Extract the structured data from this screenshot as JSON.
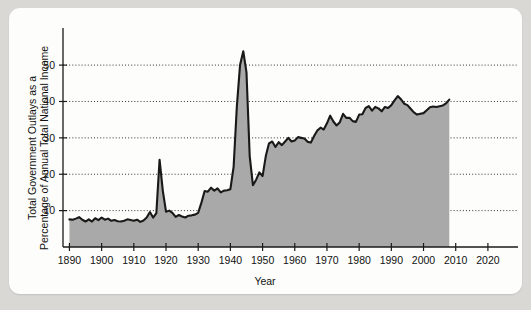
{
  "figure": {
    "background_color": "#d9d8d4",
    "panel_color": "#fdfdfb",
    "area_fill_color": "#a9a9a9",
    "line_color": "#191919"
  },
  "chart_data": {
    "type": "area",
    "title": "",
    "subtitle": "",
    "xlabel": "Year",
    "ylabel": "Total Government Outlays as a Percentage of Annual Total National Income",
    "ylabel_line1": "Total Government Outlays as a",
    "ylabel_line2": "Percentage of Annual Total National Income",
    "xlim": [
      1888,
      2025
    ],
    "ylim": [
      0,
      58
    ],
    "grid": "horizontal-dotted",
    "legend": "none",
    "xticks": [
      1890,
      1900,
      1910,
      1920,
      1930,
      1940,
      1950,
      1960,
      1970,
      1980,
      1990,
      2000,
      2010,
      2020
    ],
    "xticklabels": [
      "1890",
      "1900",
      "1910",
      "1920",
      "1930",
      "1940",
      "1950",
      "1960",
      "1970",
      "1980",
      "1990",
      "2000",
      "2010",
      "2020"
    ],
    "yticks": [
      10,
      20,
      30,
      40,
      50
    ],
    "yticklabels": [
      "10",
      "20",
      "30",
      "40",
      "50"
    ],
    "series": [
      {
        "name": "Total Government Outlays",
        "x": [
          1890,
          1891,
          1892,
          1893,
          1894,
          1895,
          1896,
          1897,
          1898,
          1899,
          1900,
          1901,
          1902,
          1903,
          1904,
          1905,
          1906,
          1907,
          1908,
          1909,
          1910,
          1911,
          1912,
          1913,
          1914,
          1915,
          1916,
          1917,
          1918,
          1919,
          1920,
          1921,
          1922,
          1923,
          1924,
          1925,
          1926,
          1927,
          1928,
          1929,
          1930,
          1931,
          1932,
          1933,
          1934,
          1935,
          1936,
          1937,
          1938,
          1939,
          1940,
          1941,
          1942,
          1943,
          1944,
          1945,
          1946,
          1947,
          1948,
          1949,
          1950,
          1951,
          1952,
          1953,
          1954,
          1955,
          1956,
          1957,
          1958,
          1959,
          1960,
          1961,
          1962,
          1963,
          1964,
          1965,
          1966,
          1967,
          1968,
          1969,
          1970,
          1971,
          1972,
          1973,
          1974,
          1975,
          1976,
          1977,
          1978,
          1979,
          1980,
          1981,
          1982,
          1983,
          1984,
          1985,
          1986,
          1987,
          1988,
          1989,
          1990,
          1991,
          1992,
          1993,
          1994,
          1995,
          1996,
          1997,
          1998,
          1999,
          2000,
          2001,
          2002,
          2003,
          2004,
          2005,
          2006,
          2007,
          2008
        ],
        "values": [
          7.6,
          7.5,
          7.8,
          8.2,
          7.5,
          7.0,
          7.6,
          7.0,
          7.9,
          7.4,
          8.1,
          7.5,
          7.8,
          7.2,
          7.4,
          7.1,
          7.0,
          7.2,
          7.6,
          7.4,
          7.2,
          7.5,
          6.9,
          7.3,
          8.1,
          9.6,
          8.1,
          9.3,
          24.0,
          15.5,
          9.7,
          10.0,
          9.4,
          8.3,
          8.8,
          8.4,
          8.1,
          8.6,
          8.7,
          8.9,
          9.4,
          12.2,
          15.4,
          15.2,
          16.3,
          15.5,
          16.1,
          15.0,
          15.5,
          15.6,
          15.9,
          22.0,
          38.5,
          50.0,
          53.8,
          48.0,
          25.0,
          17.0,
          18.5,
          20.5,
          19.5,
          25.0,
          28.5,
          29.0,
          27.5,
          28.8,
          28.0,
          29.0,
          30.0,
          29.0,
          29.3,
          30.2,
          30.0,
          29.8,
          28.9,
          28.7,
          30.5,
          32.0,
          32.8,
          32.3,
          34.0,
          36.1,
          34.5,
          33.4,
          34.3,
          36.6,
          35.5,
          35.5,
          34.6,
          34.4,
          36.4,
          36.5,
          38.2,
          38.7,
          37.5,
          38.5,
          38.1,
          37.3,
          38.5,
          38.2,
          39.0,
          40.3,
          41.5,
          40.6,
          39.4,
          39.0,
          38.0,
          37.0,
          36.4,
          36.6,
          36.8,
          37.6,
          38.4,
          38.6,
          38.5,
          38.7,
          38.9,
          39.5,
          40.5
        ]
      }
    ],
    "annotations": [
      {
        "label": "World War I peak",
        "x": 1918,
        "y": 24.0
      },
      {
        "label": "World War II peak",
        "x": 1944,
        "y": 53.8
      },
      {
        "label": "Series end",
        "x": 2008,
        "y": 40.5
      }
    ]
  }
}
